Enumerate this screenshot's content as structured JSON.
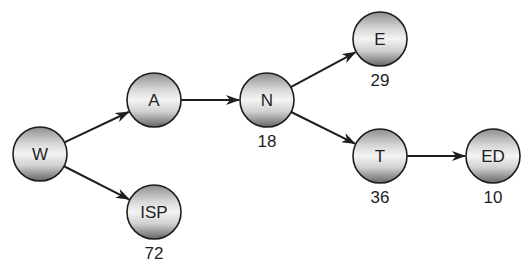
{
  "diagram": {
    "type": "directed-graph",
    "nodes": [
      {
        "id": "W",
        "label": "W",
        "cx": 40,
        "cy": 154,
        "count": null
      },
      {
        "id": "A",
        "label": "A",
        "cx": 154,
        "cy": 100,
        "count": null
      },
      {
        "id": "N",
        "label": "N",
        "cx": 267,
        "cy": 100,
        "count": "18"
      },
      {
        "id": "E",
        "label": "E",
        "cx": 380,
        "cy": 39,
        "count": "29"
      },
      {
        "id": "T",
        "label": "T",
        "cx": 380,
        "cy": 156,
        "count": "36"
      },
      {
        "id": "ED",
        "label": "ED",
        "cx": 493,
        "cy": 156,
        "count": "10"
      },
      {
        "id": "ISP",
        "label": "ISP",
        "cx": 154,
        "cy": 212,
        "count": "72"
      }
    ],
    "edges": [
      {
        "from": "W",
        "to": "A"
      },
      {
        "from": "W",
        "to": "ISP"
      },
      {
        "from": "A",
        "to": "N"
      },
      {
        "from": "N",
        "to": "E"
      },
      {
        "from": "N",
        "to": "T"
      },
      {
        "from": "T",
        "to": "ED"
      }
    ],
    "node_radius": 27,
    "colors": {
      "stroke": "#1e1e1e",
      "fill_top": "#9a9a9a",
      "fill_mid": "#f2f2f2",
      "fill_bottom": "#6e6e6e",
      "text": "#1e1e1e"
    }
  }
}
